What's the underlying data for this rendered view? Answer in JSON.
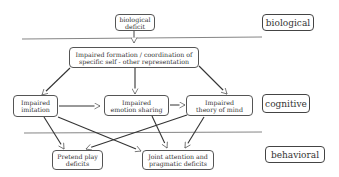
{
  "levels": {
    "biological": "biological",
    "cognitive": "cognitive",
    "behavioral": "behavioral"
  },
  "nodes": {
    "bio_deficit": [
      "biological",
      "deficit"
    ],
    "self_other": [
      "Impaired formation / coordination of",
      "specific self - other representation"
    ],
    "imitation": [
      "Impaired",
      "imitation"
    ],
    "emotion": [
      "Impaired",
      "emotion sharing"
    ],
    "tom": [
      "Impaired",
      "theory of mind"
    ],
    "pretend": [
      "Pretend play",
      "deficits"
    ],
    "joint": [
      "Joint attention and",
      "pragmatic deficits"
    ]
  },
  "edges": [
    {
      "from": "biological deficit",
      "to": "Impaired formation / coordination of specific self - other representation"
    },
    {
      "from": "self-other representation",
      "to": "Impaired imitation"
    },
    {
      "from": "self-other representation",
      "to": "Impaired emotion sharing"
    },
    {
      "from": "self-other representation",
      "to": "Impaired theory of mind"
    },
    {
      "from": "Impaired imitation",
      "to": "Impaired emotion sharing"
    },
    {
      "from": "Impaired emotion sharing",
      "to": "Impaired theory of mind"
    },
    {
      "from": "Impaired imitation",
      "to": "Pretend play deficits"
    },
    {
      "from": "Impaired imitation",
      "to": "Joint attention and pragmatic deficits"
    },
    {
      "from": "Impaired emotion sharing",
      "to": "Joint attention and pragmatic deficits"
    },
    {
      "from": "Impaired theory of mind",
      "to": "Pretend play deficits"
    },
    {
      "from": "Impaired theory of mind",
      "to": "Joint attention and pragmatic deficits"
    }
  ]
}
